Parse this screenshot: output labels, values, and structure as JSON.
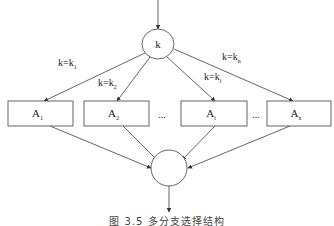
{
  "diagram": {
    "type": "flowchart",
    "entry_arrow": {
      "from": [
        158,
        0
      ],
      "to": [
        158,
        29
      ]
    },
    "decision_node": {
      "label": "k",
      "cx": 158,
      "cy": 44,
      "rx": 16,
      "ry": 15
    },
    "branches": [
      {
        "id": "A1",
        "box_label": "A",
        "box_sub": "1",
        "cond_main": "k=k",
        "cond_sub": "1",
        "box": {
          "x": 8,
          "y": 101,
          "w": 65,
          "h": 25
        },
        "cond_pos": [
          58,
          66
        ],
        "edge_in": {
          "from": [
            145,
            53
          ],
          "to": [
            44,
            101
          ]
        },
        "edge_out": {
          "from": [
            50,
            126
          ],
          "to": [
            151,
            168
          ]
        }
      },
      {
        "id": "A2",
        "box_label": "A",
        "box_sub": "2",
        "cond_main": "k=k",
        "cond_sub": "2",
        "box": {
          "x": 84,
          "y": 101,
          "w": 65,
          "h": 25
        },
        "cond_pos": [
          98,
          86
        ],
        "edge_in": {
          "from": [
            150,
            57
          ],
          "to": [
            117,
            101
          ]
        },
        "edge_out": {
          "from": [
            123,
            126
          ],
          "to": [
            157,
            160
          ]
        }
      },
      {
        "id": "Ai",
        "box_label": "A",
        "box_sub": "i",
        "cond_main": "k=k",
        "cond_sub": "i",
        "box": {
          "x": 181,
          "y": 101,
          "w": 66,
          "h": 25
        },
        "cond_pos": [
          204,
          80
        ],
        "edge_in": {
          "from": [
            167,
            57
          ],
          "to": [
            215,
            101
          ]
        },
        "edge_out": {
          "from": [
            215,
            126
          ],
          "to": [
            182,
            160
          ]
        }
      },
      {
        "id": "An",
        "box_label": "A",
        "box_sub": "n",
        "cond_main": "k=k",
        "cond_sub": "n",
        "box": {
          "x": 267,
          "y": 101,
          "w": 64,
          "h": 25
        },
        "cond_pos": [
          222,
          60
        ],
        "edge_in": {
          "from": [
            174,
            49
          ],
          "to": [
            293,
            101
          ]
        },
        "edge_out": {
          "from": [
            290,
            126
          ],
          "to": [
            188,
            168
          ]
        }
      }
    ],
    "ellipses": [
      {
        "text": "...",
        "x": 162,
        "y": 118
      },
      {
        "text": "...",
        "x": 256,
        "y": 118
      }
    ],
    "merge_node": {
      "label": "",
      "cx": 169,
      "cy": 168,
      "rx": 18,
      "ry": 18
    },
    "exit_arrow": {
      "from": [
        169,
        186
      ],
      "to": [
        169,
        212
      ]
    },
    "colors": {
      "stroke": "#555555",
      "text": "#222222",
      "background": "#ffffff"
    }
  },
  "caption": "图 3.5  多分支选择结构"
}
